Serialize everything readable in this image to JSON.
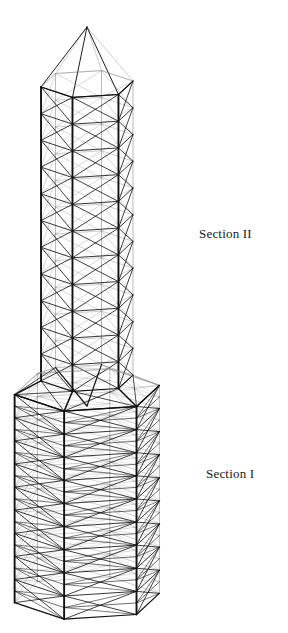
{
  "figure": {
    "kind": "engineering-line-drawing",
    "background_color": "#ffffff",
    "line_color": "#1a1a1a",
    "near_line_color": "#111111",
    "far_line_color": "#8a8a8a",
    "view": "three-quarter perspective, viewed slightly from below"
  },
  "labels": {
    "section_upper": "Section II",
    "section_lower": "Section I"
  },
  "structure": {
    "sides": 6,
    "sections": [
      {
        "name": "Section II",
        "position": "upper",
        "radius": 47,
        "panels": 11,
        "bracing": "X-bracing with horizontal rings",
        "cap": "hexagonal pyramid apex",
        "top_y": 27,
        "bottom_y": 378
      },
      {
        "name": "Section I",
        "position": "lower",
        "radius": 74,
        "panels": 9,
        "bracing": "X-bracing with horizontal rings and mid diagonals",
        "top_y": 390,
        "bottom_y": 598
      }
    ],
    "transition": {
      "description": "splayed struts from Section I top ring to Section II base ring",
      "top_y": 352,
      "bottom_y": 400
    }
  },
  "geometry_params": {
    "center_x": 87,
    "apex_y": 27,
    "apex_base_y": 84,
    "sec2_top_y": 84,
    "sec2_bottom_y": 378,
    "sec2_radius": 47,
    "sec1_top_y": 390,
    "sec1_bottom_y": 598,
    "sec1_radius": 74,
    "sec2_panels": 11,
    "sec1_panels": 9,
    "ellipse_squash": 0.3,
    "rotation_deg": 12
  }
}
